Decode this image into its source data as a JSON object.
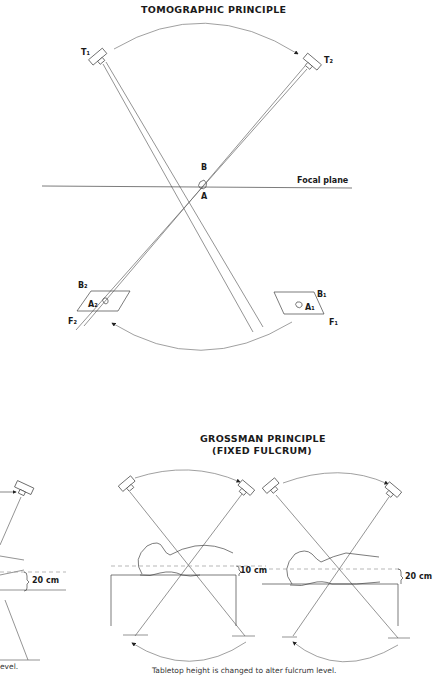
{
  "top_diagram": {
    "title": "TOMOGRAPHIC PRINCIPLE",
    "labels": {
      "t1": "T₁",
      "t2": "T₂",
      "b": "B",
      "a": "A",
      "focal_plane": "Focal plane",
      "b2": "B₂",
      "a2": "A₂",
      "f2": "F₂",
      "b1": "B₁",
      "a1": "A₁",
      "f1": "F₁"
    }
  },
  "bottom_diagram": {
    "title_line1": "GROSSMAN PRINCIPLE",
    "title_line2": "(FIXED FULCRUM)",
    "left_partial_measure": "20 cm",
    "middle_measure": "10 cm",
    "right_measure": "20 cm",
    "left_partial_caption": "evel.",
    "caption": "Tabletop height is changed to alter fulcrum level."
  },
  "colors": {
    "line": "#555555",
    "text": "#1a1a1a",
    "dashed": "#999999"
  }
}
